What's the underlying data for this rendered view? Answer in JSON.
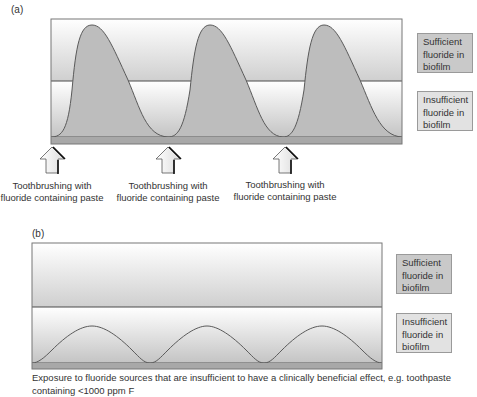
{
  "panel_a": {
    "label": "(a)",
    "legend": {
      "sufficient": "Sufficient fluoride in biofilm",
      "insufficient": "Insufficient fluoride in biofilm"
    },
    "arrows": [
      {
        "label": "Toothbrushing with fluoride containing paste"
      },
      {
        "label": "Toothbrushing with fluoride containing paste"
      },
      {
        "label": "Toothbrushing with fluoride containing paste"
      }
    ],
    "curve": "three sharp peaks rising well above the sufficiency threshold after each toothbrushing event, decaying back to baseline"
  },
  "panel_b": {
    "label": "(b)",
    "legend": {
      "sufficient": "Sufficient fluoride in biofilm",
      "insufficient": "Insufficient fluoride in biofilm"
    },
    "caption": "Exposure to fluoride sources that are insufficient to have a clinically beneficial effect, e.g. toothpaste containing <1000 ppm F",
    "curve": "three low sinusoidal humps that stay below the sufficiency threshold"
  },
  "colors": {
    "curve_fill": "#bdbdbd",
    "curve_stroke": "#5a5a5a",
    "threshold_line": "#4a4a4a",
    "baseline_strip": "#a8a8a8",
    "legend_sufficient_bg": "#c9c9c9",
    "legend_insufficient_bg": "#e2e2e2"
  }
}
